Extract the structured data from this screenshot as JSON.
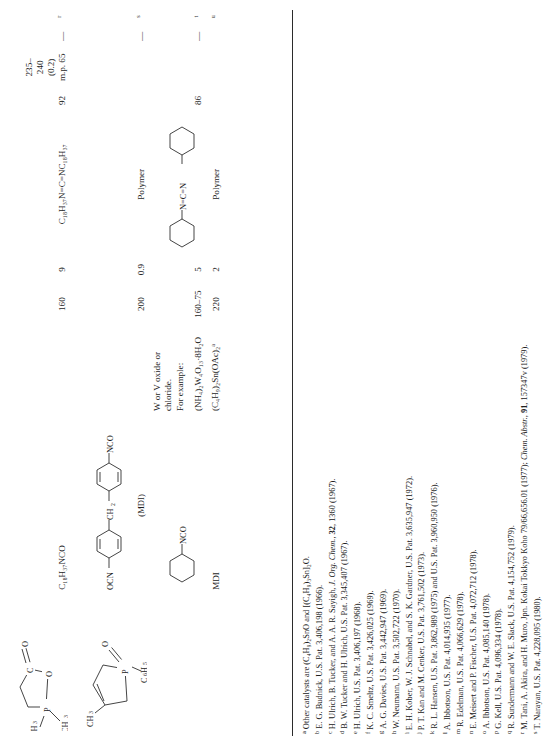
{
  "table": {
    "rows": [
      {
        "structure_label": "phospholane-oxide-1",
        "substrate": "C18H37NCO",
        "substrate_text": "C₁₈H₃₇NCO",
        "catalyst": "",
        "temperature": "160",
        "time": "9",
        "product": "C₁₈H₃₇N=C=NC₁₈H₃₇",
        "yield": "92",
        "bp_mp": [
          "235–240",
          "(0.2)",
          "m.p. 65"
        ],
        "extra": "—",
        "ref": "r"
      },
      {
        "structure_label": "methyl-phospholene-oxide",
        "substrate": "MDI-structure",
        "substrate_caption": "(MDI)",
        "substrate_left": "OCN",
        "substrate_mid": "CH₂",
        "substrate_right": "NCO",
        "catalyst": "",
        "temperature": "200",
        "time": "0.9",
        "product": "Polymer",
        "yield": "",
        "bp_mp": [],
        "extra": "—",
        "ref": "s"
      },
      {
        "structure_label": "",
        "substrate": "cyclohexyl-NCO",
        "substrate_text": "NCO",
        "catalyst_lines": [
          "W or V oxide or",
          "chloride.",
          "For example:"
        ],
        "catalyst": "(NH₄)₂W₄O₁₃·8H₂O",
        "temperature": "160–75",
        "time": "5",
        "product": "dicyclohexylcarbodiimide",
        "product_text": "N=C=N",
        "yield": "86",
        "bp_mp": [],
        "extra": "—",
        "ref": "t"
      },
      {
        "structure_label": "",
        "substrate": "MDI",
        "substrate_text": "MDI",
        "catalyst": "(C₄H₉)₂Sn(OAc)₂",
        "catalyst_mark": "a",
        "temperature": "220",
        "time": "2",
        "product": "Polymer",
        "yield": "",
        "bp_mp": [],
        "extra": "",
        "ref": "u"
      }
    ]
  },
  "footnotes": [
    {
      "mark": "a",
      "text": "Other catalysts are (C₄H₉)₂SnO and [(C₄H₉)₃Sn]₂O."
    },
    {
      "mark": "b",
      "text": "E. G. Budnick, U.S. Pat. 3,406,198 (1966)."
    },
    {
      "mark": "c",
      "pre": "H. Ulrich, B. Tucker, and A. A. R. Sayigh, ",
      "italic": "J. Org. Chem.",
      "bold": "32",
      "post": ", 1360 (1967)."
    },
    {
      "mark": "d",
      "text": "B. W. Tucker and H. Ulrich, U.S. Pat. 3,345,407 (1967)."
    },
    {
      "mark": "e",
      "text": "H. Ulrich, U.S. Pat. 3,406,197 (1968)."
    },
    {
      "mark": "f",
      "text": "K. C. Smeltz, U.S. Pat. 3,426,025 (1969)."
    },
    {
      "mark": "g",
      "text": "A. G. Davies, U.S. Pat. 3,442,947 (1969)."
    },
    {
      "mark": "h",
      "text": "W. Neumann, U.S. Pat. 3,502,722 (1970)."
    },
    {
      "mark": "i",
      "text": "E. H. Kober, W. J. Schnabel, and S. K. Gardner, U.S. Pat. 3,635,947 (1972)."
    },
    {
      "mark": "j",
      "text": "P. T. Kan and M. Cenker, U.S. Pat. 3,761,502 (1973)."
    },
    {
      "mark": "k",
      "text": "R. L. Hansen, U.S. Pat. 3,862,989 (1975) and U.S. Pat. 3,960,950 (1976)."
    },
    {
      "mark": "l",
      "text": "A. Ibbotson, U.S. Pat. 4,014,935 (1977)."
    },
    {
      "mark": "m",
      "text": "R. Edelman, U.S. Pat. 4,066,629 (1978)."
    },
    {
      "mark": "n",
      "text": "E. Meisert and P. Fischer, U.S. Pat. 4,072,712 (1978)."
    },
    {
      "mark": "o",
      "text": "A. Ibbotson, U.S. Pat. 4,085,140 (1978)."
    },
    {
      "mark": "p",
      "text": "G. Kell, U.S. Pat. 4,096,334 (1978)."
    },
    {
      "mark": "q",
      "text": "R. Sundermann and W. E. Slack, U.S. Pat. 4,154,752 (1979)."
    },
    {
      "mark": "r",
      "pre": "M. Tani, A. Akira, and H. Muro, Jpn. Kokai Tokkyo Koho 79/66,656.01 (1977); ",
      "italic": "Chem. Abstr.",
      "bold": "91",
      "post": ", 157347v (1979)."
    },
    {
      "mark": "s",
      "text": "T. Narayan, U.S. Pat. 4,228,095 (1980)."
    }
  ]
}
